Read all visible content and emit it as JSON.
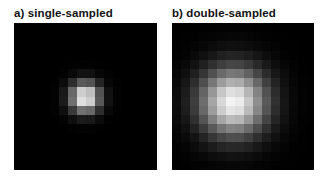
{
  "figure": {
    "panels": [
      {
        "label": "a) single-sampled",
        "description": "Point-spread blob rendered with single sampling: small, sharp pixelated bright spot on black background",
        "grid": {
          "cols": 16,
          "rows": 16,
          "cell_px": 9,
          "center_col": 7.9,
          "center_row": 8.1,
          "sigma_cells": 1.15,
          "peak": 250
        }
      },
      {
        "label": "b) double-sampled",
        "description": "Point-spread blob rendered with double sampling: larger, softer pixelated bright spot on black background",
        "grid": {
          "cols": 16,
          "rows": 16,
          "cell_px": 9,
          "center_col": 6.8,
          "center_row": 8.6,
          "sigma_cells": 2.6,
          "peak": 245
        }
      }
    ]
  }
}
